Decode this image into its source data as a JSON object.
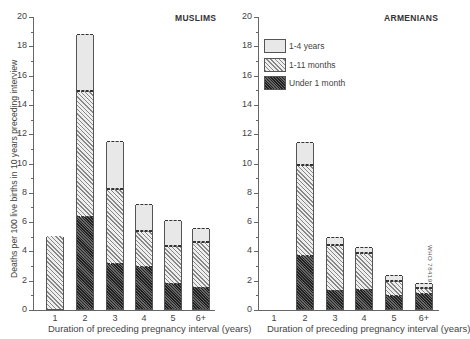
{
  "chart_data": [
    {
      "type": "bar",
      "stacked": true,
      "title": "MUSLIMS",
      "xlabel": "Duration of preceding pregnancy interval (years)",
      "ylabel": "Deaths per 100 live births in 10 years preceding interview",
      "ylim": [
        0,
        20
      ],
      "yticks": [
        0,
        2,
        4,
        6,
        8,
        10,
        12,
        14,
        16,
        18,
        20
      ],
      "grid": false,
      "categories": [
        "1",
        "2",
        "3",
        "4",
        "5",
        "6+"
      ],
      "series": [
        {
          "name": "Under 1 month",
          "values": [
            0,
            6.3,
            3.1,
            2.9,
            1.7,
            1.4
          ]
        },
        {
          "name": "1-11 months",
          "values": [
            5.0,
            8.6,
            5.1,
            2.4,
            2.6,
            3.2
          ]
        },
        {
          "name": "1-4 years",
          "values": [
            0,
            3.9,
            3.3,
            1.9,
            1.8,
            0.9
          ]
        }
      ],
      "totals": [
        5.0,
        18.8,
        11.5,
        7.2,
        6.1,
        5.5
      ]
    },
    {
      "type": "bar",
      "stacked": true,
      "title": "ARMENIANS",
      "xlabel": "Duration of preceding pregnancy interval (years)",
      "ylim": [
        0,
        20
      ],
      "yticks": [
        0,
        2,
        4,
        6,
        8,
        10,
        12,
        14,
        16,
        18,
        20
      ],
      "grid": false,
      "categories": [
        "1",
        "2",
        "3",
        "4",
        "5",
        "6+"
      ],
      "series": [
        {
          "name": "Under 1 month",
          "values": [
            0,
            3.6,
            1.2,
            1.3,
            0.9,
            1.0
          ]
        },
        {
          "name": "1-11 months",
          "values": [
            0,
            6.2,
            3.2,
            2.5,
            1.0,
            0.4
          ]
        },
        {
          "name": "1-4 years",
          "values": [
            0,
            1.6,
            0.5,
            0.4,
            0.4,
            0.4
          ]
        }
      ],
      "totals": [
        0,
        11.4,
        4.9,
        4.2,
        2.3,
        1.8
      ],
      "legend": {
        "position": "upper-left",
        "entries": [
          "1-4 years",
          "1-11 months",
          "Under 1 month"
        ]
      },
      "annotation": "WHO 78419"
    }
  ],
  "left": {
    "title": "MUSLIMS",
    "ylabel": "Deaths per 100 live births in 10 years preceding interview",
    "xlabel": "Duration of preceding pregnancy interval (years)"
  },
  "right": {
    "title": "ARMENIANS",
    "xlabel": "Duration of preceding pregnancy interval (years)",
    "legend": [
      "1-4 years",
      "1-11 months",
      "Under 1 month"
    ],
    "side_code": "WHO 78419"
  }
}
